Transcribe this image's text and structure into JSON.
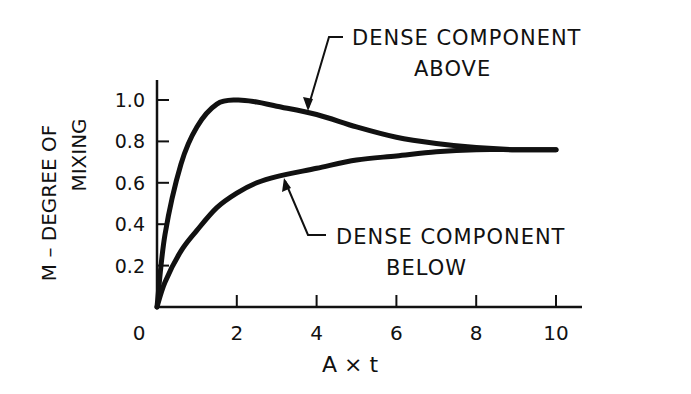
{
  "chart_data": {
    "type": "line",
    "title": "",
    "xlabel": "A × t",
    "ylabel_line1": "M – DEGREE OF",
    "ylabel_line2": "MIXING",
    "xlim": [
      0,
      10
    ],
    "ylim": [
      0,
      1.0
    ],
    "x_ticks": [
      0,
      2,
      4,
      6,
      8,
      10
    ],
    "x_tick_labels": [
      "0",
      "2",
      "4",
      "6",
      "8",
      "10"
    ],
    "y_ticks": [
      0.2,
      0.4,
      0.6,
      0.8,
      1.0
    ],
    "y_tick_labels": [
      "0.2",
      "0.4",
      "0.6",
      "0.8",
      "1.0"
    ],
    "grid": false,
    "legend": "annotations",
    "series": [
      {
        "name": "DENSE COMPONENT ABOVE",
        "x": [
          0,
          0.2,
          0.6,
          1.0,
          1.5,
          2.0,
          2.5,
          3.0,
          4.0,
          5.0,
          6.0,
          7.0,
          8.0,
          9.0,
          10.0
        ],
        "values": [
          0,
          0.35,
          0.69,
          0.87,
          0.98,
          1.0,
          0.99,
          0.97,
          0.93,
          0.87,
          0.82,
          0.79,
          0.77,
          0.76,
          0.76
        ]
      },
      {
        "name": "DENSE COMPONENT BELOW",
        "x": [
          0,
          0.2,
          0.6,
          1.0,
          1.5,
          2.0,
          2.5,
          3.0,
          4.0,
          5.0,
          6.0,
          7.0,
          8.0,
          9.0,
          10.0
        ],
        "values": [
          0,
          0.12,
          0.27,
          0.37,
          0.48,
          0.55,
          0.6,
          0.63,
          0.67,
          0.71,
          0.73,
          0.75,
          0.76,
          0.76,
          0.76
        ]
      }
    ],
    "annotations": [
      {
        "line1": "DENSE COMPONENT",
        "line2": "ABOVE",
        "points_to": [
          3.7,
          0.94
        ]
      },
      {
        "line1": "DENSE COMPONENT",
        "line2": "BELOW",
        "points_to": [
          2.7,
          0.62
        ]
      }
    ]
  }
}
